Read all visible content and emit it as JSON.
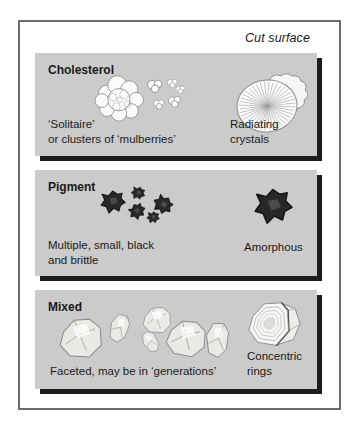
{
  "colors": {
    "panel-bg": "#cbcbcb",
    "panel-shadow": "#1d1d1d",
    "frame-border": "#6b6b6b",
    "text": "#1a1a1a",
    "stone-fill": "#fbfbfa",
    "stone-outline": "#8e8e8e",
    "pigment-fill": "#282828",
    "pigment-highlight": "#4a4a4a"
  },
  "figure": {
    "cut_surface_label": "Cut surface",
    "panels": [
      {
        "title": "Cholesterol",
        "left_caption": [
          "‘Solitaire’",
          "or clusters of ‘mulberries’"
        ],
        "right_caption": [
          "Radiating crystals"
        ],
        "illustrations": {
          "left": "solitaire-and-mulberry-cluster-stones",
          "right": "radiating-crystals-stone"
        }
      },
      {
        "title": "Pigment",
        "left_caption": [
          "Multiple, small, black",
          "and brittle"
        ],
        "right_caption": [
          "Amorphous"
        ],
        "illustrations": {
          "left": "multiple-small-black-stones",
          "right": "amorphous-black-stone"
        }
      },
      {
        "title": "Mixed",
        "left_caption": [
          "Faceted, may be in ‘generations’"
        ],
        "right_caption": [
          "Concentric",
          "rings"
        ],
        "illustrations": {
          "left": "faceted-stones-row",
          "right": "concentric-rings-stone"
        }
      }
    ]
  }
}
